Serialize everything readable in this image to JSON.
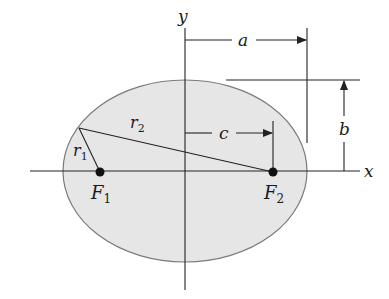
{
  "diagram": {
    "colors": {
      "fill": "#e6e6e6",
      "outline": "#7a7a7a",
      "line": "#222222"
    },
    "axes": {
      "x_label": "x",
      "y_label": "y"
    },
    "foci": [
      {
        "label": "F",
        "sub": "1"
      },
      {
        "label": "F",
        "sub": "2"
      }
    ],
    "distances": {
      "r1": {
        "label": "r",
        "sub": "1"
      },
      "r2": {
        "label": "r",
        "sub": "2"
      },
      "a": "a",
      "b": "b",
      "c": "c"
    }
  }
}
